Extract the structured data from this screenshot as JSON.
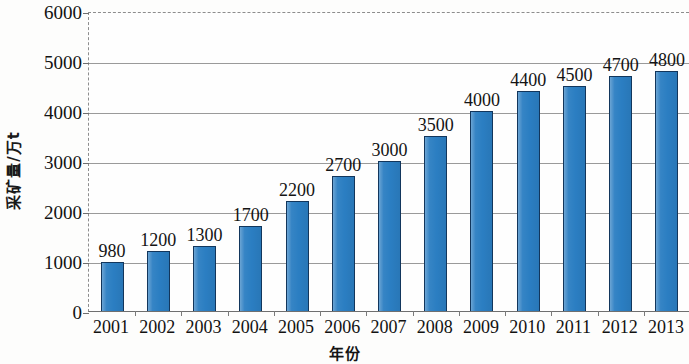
{
  "chart_data": {
    "type": "bar",
    "title": "",
    "xlabel": "年份",
    "ylabel": "采矿量/万t",
    "categories": [
      "2001",
      "2002",
      "2003",
      "2004",
      "2005",
      "2006",
      "2007",
      "2008",
      "2009",
      "2010",
      "2011",
      "2012",
      "2013"
    ],
    "values": [
      980,
      1200,
      1300,
      1700,
      2200,
      2700,
      3000,
      3500,
      4000,
      4400,
      4500,
      4700,
      4800
    ],
    "value_labels": [
      "980",
      "1200",
      "1300",
      "1700",
      "2200",
      "2700",
      "3000",
      "3500",
      "4000",
      "4400",
      "4500",
      "4700",
      "4800"
    ],
    "ylim": [
      0,
      6000
    ],
    "y_ticks": [
      0,
      1000,
      2000,
      3000,
      4000,
      5000,
      6000
    ],
    "y_tick_labels": [
      "0",
      "1000",
      "2000",
      "3000",
      "4000",
      "5000",
      "6000"
    ],
    "grid": true,
    "grid_axis": "y",
    "legend": null,
    "legend_position": "none",
    "bar_color": "#2b7ec2",
    "bar_outline_color": "#12365c",
    "gridline_color": "#9a9a9a",
    "axis_color": "#6f6f6f",
    "background_color": "#fefefe",
    "text_color": "#121212",
    "series": [
      {
        "name": "采矿量",
        "values": [
          980,
          1200,
          1300,
          1700,
          2200,
          2700,
          3000,
          3500,
          4000,
          4400,
          4500,
          4700,
          4800
        ]
      }
    ]
  }
}
